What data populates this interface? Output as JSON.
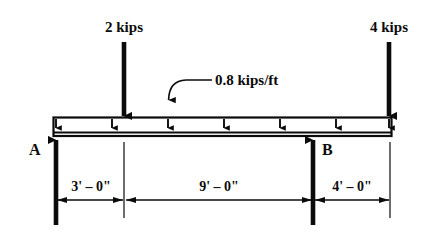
{
  "diagram": {
    "type": "free-body-diagram",
    "stroke_color": "#0b0b0b",
    "background_color": "#ffffff"
  },
  "point_loads": [
    {
      "label": "2 kips",
      "magnitude": 2,
      "unit": "kips",
      "direction": "down",
      "x_px": 124,
      "station_ft": 3
    },
    {
      "label": "4 kips",
      "magnitude": 4,
      "unit": "kips",
      "direction": "down",
      "x_px": 389,
      "station_ft": 16
    }
  ],
  "distributed_load": {
    "label": "0.8 kips/ft",
    "magnitude": 0.8,
    "unit": "kips/ft",
    "direction": "down",
    "arrow_count": 7,
    "extent": "full-length"
  },
  "supports": [
    {
      "label": "A",
      "type": "reaction",
      "direction": "up",
      "x_px": 56,
      "station_ft": 0
    },
    {
      "label": "B",
      "type": "reaction",
      "direction": "up",
      "x_px": 313,
      "station_ft": 12
    }
  ],
  "dimensions": [
    {
      "label": "3' – 0\"",
      "feet": 3,
      "inches": 0,
      "from_px": 56,
      "to_px": 124,
      "center_px": 90
    },
    {
      "label": "9' – 0\"",
      "feet": 9,
      "inches": 0,
      "from_px": 124,
      "to_px": 313,
      "center_px": 219
    },
    {
      "label": "4' – 0\"",
      "feet": 4,
      "inches": 0,
      "from_px": 313,
      "to_px": 390,
      "center_px": 352
    }
  ],
  "beam": {
    "left_px": 53,
    "right_px": 392,
    "top_px": 117,
    "bottom_px": 136
  }
}
